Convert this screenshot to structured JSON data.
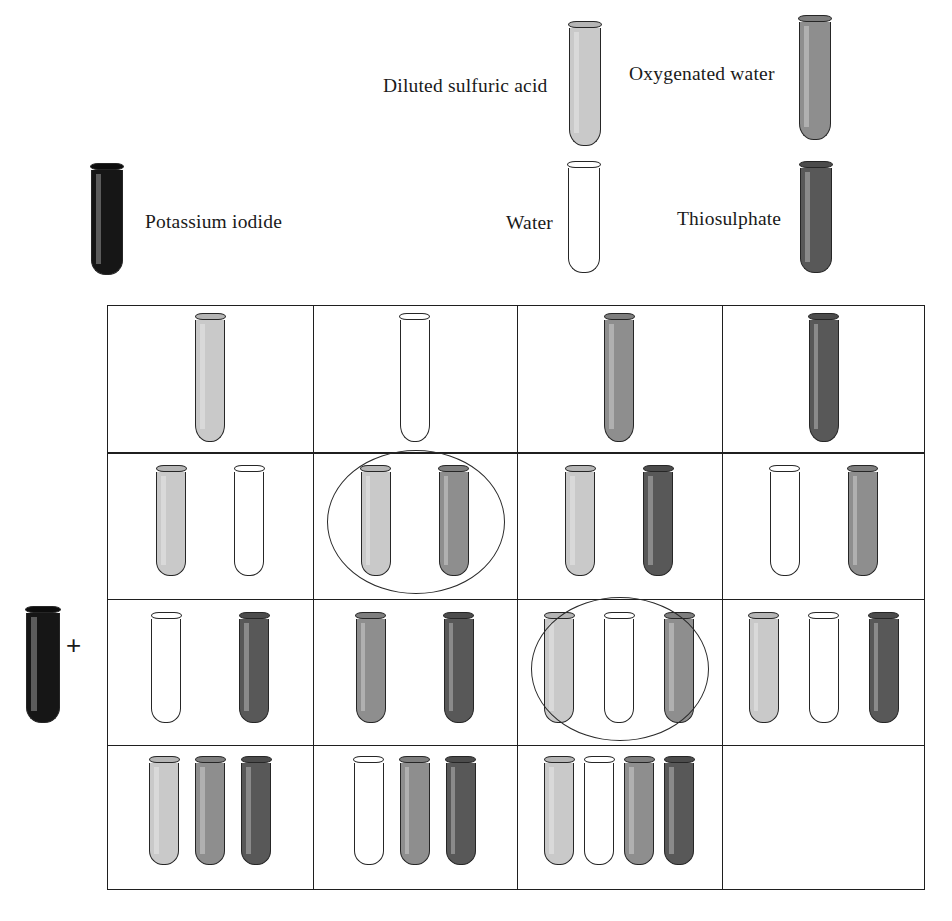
{
  "legend": {
    "items": [
      {
        "label": "Diluted sulfuric acid",
        "key": "acid",
        "fill": "#c9c9c9",
        "rim": "#b5b5b5",
        "label_x": 383,
        "label_y": 75,
        "tube_x": 569,
        "tube_y": 28,
        "tube_h": 118
      },
      {
        "label": "Oxygenated water",
        "key": "oxy",
        "fill": "#8e8e8e",
        "rim": "#7e7e7e",
        "label_x": 629,
        "label_y": 63,
        "tube_x": 799,
        "tube_y": 22,
        "tube_h": 118
      },
      {
        "label": "Potassium iodide",
        "key": "iodide",
        "fill": "#161616",
        "rim": "#0d0d0d",
        "label_x": 145,
        "label_y": 211,
        "tube_x": 91,
        "tube_y": 170,
        "tube_h": 105
      },
      {
        "label": "Water",
        "key": "water",
        "fill": "#ffffff",
        "rim": "#ffffff",
        "label_x": 506,
        "label_y": 212,
        "tube_x": 568,
        "tube_y": 168,
        "tube_h": 105
      },
      {
        "label": "Thiosulphate",
        "key": "thio",
        "fill": "#585858",
        "rim": "#4c4c4c",
        "label_x": 677,
        "label_y": 208,
        "tube_x": 800,
        "tube_y": 168,
        "tube_h": 105
      }
    ]
  },
  "reactant": {
    "tube_key": "iodide",
    "plus_symbol": "+"
  },
  "colors": {
    "acid": "#c9c9c9",
    "oxy": "#8e8e8e",
    "iodide": "#161616",
    "water": "#ffffff",
    "thio": "#585858",
    "line": "#1f1f1f",
    "page_background": "#ffffff"
  },
  "grid": {
    "rows": 4,
    "cols": 4,
    "cells": [
      {
        "row": 1,
        "col": 1,
        "tubes": [
          "acid"
        ],
        "highlighted": false
      },
      {
        "row": 1,
        "col": 2,
        "tubes": [
          "water"
        ],
        "highlighted": false
      },
      {
        "row": 1,
        "col": 3,
        "tubes": [
          "oxy"
        ],
        "highlighted": false
      },
      {
        "row": 1,
        "col": 4,
        "tubes": [
          "thio"
        ],
        "highlighted": false
      },
      {
        "row": 2,
        "col": 1,
        "tubes": [
          "acid",
          "water"
        ],
        "highlighted": false
      },
      {
        "row": 2,
        "col": 2,
        "tubes": [
          "acid",
          "oxy"
        ],
        "highlighted": true
      },
      {
        "row": 2,
        "col": 3,
        "tubes": [
          "acid",
          "thio"
        ],
        "highlighted": false
      },
      {
        "row": 2,
        "col": 4,
        "tubes": [
          "water",
          "oxy"
        ],
        "highlighted": false
      },
      {
        "row": 3,
        "col": 1,
        "tubes": [
          "water",
          "thio"
        ],
        "highlighted": false
      },
      {
        "row": 3,
        "col": 2,
        "tubes": [
          "oxy",
          "thio"
        ],
        "highlighted": false
      },
      {
        "row": 3,
        "col": 3,
        "tubes": [
          "acid",
          "water",
          "oxy"
        ],
        "highlighted": true
      },
      {
        "row": 3,
        "col": 4,
        "tubes": [
          "acid",
          "water",
          "thio"
        ],
        "highlighted": false
      },
      {
        "row": 4,
        "col": 1,
        "tubes": [
          "acid",
          "oxy",
          "thio"
        ],
        "highlighted": false
      },
      {
        "row": 4,
        "col": 2,
        "tubes": [
          "water",
          "oxy",
          "thio"
        ],
        "highlighted": false
      },
      {
        "row": 4,
        "col": 3,
        "tubes": [
          "acid",
          "water",
          "oxy",
          "thio"
        ],
        "highlighted": false
      },
      {
        "row": 4,
        "col": 4,
        "tubes": [],
        "highlighted": false
      }
    ]
  }
}
